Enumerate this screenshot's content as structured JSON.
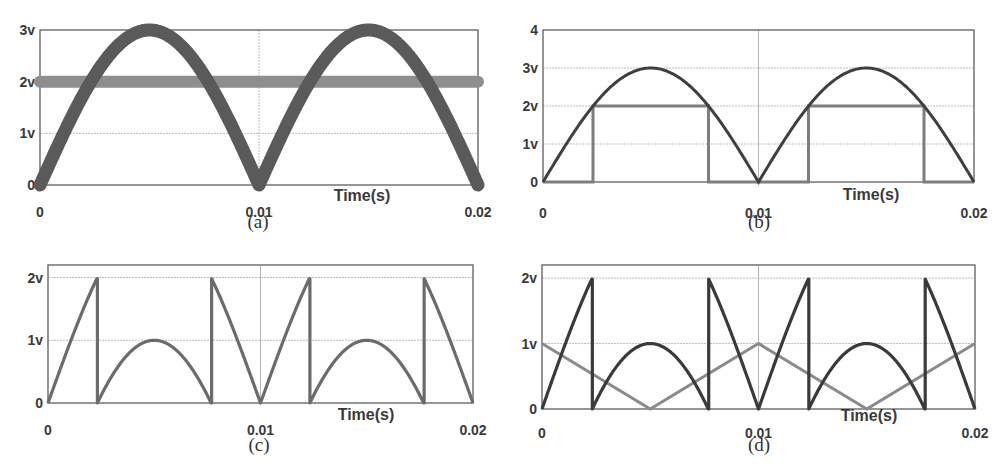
{
  "figure": {
    "panels": [
      {
        "id": "a",
        "caption": "(a)",
        "y_ticks": [
          "3v",
          "2v",
          "1v",
          "0"
        ],
        "x_ticks": [
          "0",
          "0.01",
          "0.02"
        ],
        "xlabel": "Time(s)"
      },
      {
        "id": "b",
        "caption": "(b)",
        "y_ticks": [
          "4",
          "3v",
          "2v",
          "1v",
          "0"
        ],
        "x_ticks": [
          "0",
          "0.01",
          "0.02"
        ],
        "xlabel": "Time(s)"
      },
      {
        "id": "c",
        "caption": "(c)",
        "y_ticks": [
          "2v",
          "1v",
          "0"
        ],
        "x_ticks": [
          "0",
          "0.01",
          "0.02"
        ],
        "xlabel": "Time(s)"
      },
      {
        "id": "d",
        "caption": "(d)",
        "y_ticks": [
          "2v",
          "1v",
          "0"
        ],
        "x_ticks": [
          "0",
          "0.01",
          "0.02"
        ],
        "xlabel": "Time(s)"
      }
    ],
    "colors": {
      "dark_trace": "#4a4a4a",
      "light_trace": "#8c8c8c",
      "frame": "#6a6a6a",
      "grid": "#bdbdbd"
    }
  },
  "chart_data": [
    {
      "panel": "a",
      "type": "line",
      "title": "",
      "xlabel": "Time(s)",
      "ylabel": "",
      "xlim": [
        0,
        0.02
      ],
      "ylim": [
        0,
        3
      ],
      "x_tick_labels": [
        "0",
        "0.01",
        "0.02"
      ],
      "y_tick_labels": [
        "0",
        "1v",
        "2v",
        "3v"
      ],
      "grid": true,
      "series": [
        {
          "name": "rectified sine |3 sin(2π·50t)|",
          "x": [
            0,
            0.0025,
            0.005,
            0.0075,
            0.01,
            0.0125,
            0.015,
            0.0175,
            0.02
          ],
          "values": [
            0,
            2.12,
            3,
            2.12,
            0,
            2.12,
            3,
            2.12,
            0
          ],
          "style": "thick dark"
        },
        {
          "name": "constant level 2v",
          "x": [
            0,
            0.02
          ],
          "values": [
            2,
            2
          ],
          "style": "thick light"
        }
      ]
    },
    {
      "panel": "b",
      "type": "line",
      "title": "",
      "xlabel": "Time(s)",
      "ylabel": "",
      "xlim": [
        0,
        0.02
      ],
      "ylim": [
        0,
        4
      ],
      "x_tick_labels": [
        "0",
        "0.01",
        "0.02"
      ],
      "y_tick_labels": [
        "0",
        "1v",
        "2v",
        "3v",
        "4"
      ],
      "grid": true,
      "series": [
        {
          "name": "rectified sine |3 sin(2π·50t)|",
          "x": [
            0,
            0.0025,
            0.005,
            0.0075,
            0.01,
            0.0125,
            0.015,
            0.0175,
            0.02
          ],
          "values": [
            0,
            2.12,
            3,
            2.12,
            0,
            2.12,
            3,
            2.12,
            0
          ]
        },
        {
          "name": "2v pulse (sine ≥ 2v)",
          "x": [
            0,
            0.00232,
            0.00232,
            0.00768,
            0.00768,
            0.01232,
            0.01232,
            0.01768,
            0.01768,
            0.02
          ],
          "values": [
            0,
            0,
            2,
            2,
            0,
            0,
            2,
            2,
            0,
            0
          ]
        }
      ]
    },
    {
      "panel": "c",
      "type": "line",
      "title": "",
      "xlabel": "Time(s)",
      "ylabel": "",
      "xlim": [
        0,
        0.02
      ],
      "ylim": [
        0,
        2.2
      ],
      "x_tick_labels": [
        "0",
        "0.01",
        "0.02"
      ],
      "y_tick_labels": [
        "0",
        "1v",
        "2v"
      ],
      "grid": true,
      "series": [
        {
          "name": "residual waveform",
          "x": [
            0,
            0.00232,
            0.00232,
            0.005,
            0.00768,
            0.00768,
            0.01,
            0.01232,
            0.01232,
            0.015,
            0.01768,
            0.01768,
            0.02
          ],
          "values": [
            0,
            2,
            0,
            1,
            0,
            2,
            0,
            2,
            0,
            1,
            0,
            2,
            0
          ]
        }
      ]
    },
    {
      "panel": "d",
      "type": "line",
      "title": "",
      "xlabel": "Time(s)",
      "ylabel": "",
      "xlim": [
        0,
        0.02
      ],
      "ylim": [
        0,
        2.2
      ],
      "x_tick_labels": [
        "0",
        "0.01",
        "0.02"
      ],
      "y_tick_labels": [
        "0",
        "1v",
        "2v"
      ],
      "grid": true,
      "series": [
        {
          "name": "residual waveform",
          "x": [
            0,
            0.00232,
            0.00232,
            0.005,
            0.00768,
            0.00768,
            0.01,
            0.01232,
            0.01232,
            0.015,
            0.01768,
            0.01768,
            0.02
          ],
          "values": [
            0,
            2,
            0,
            1,
            0,
            2,
            0,
            2,
            0,
            1,
            0,
            2,
            0
          ]
        },
        {
          "name": "triangular carrier",
          "x": [
            0,
            0.005,
            0.01,
            0.015,
            0.02
          ],
          "values": [
            1,
            0,
            1,
            0,
            1
          ]
        }
      ]
    }
  ]
}
